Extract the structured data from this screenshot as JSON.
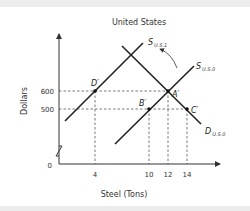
{
  "diagram": {
    "title": "United States",
    "x_axis_label": "Steel (Tons)",
    "y_axis_label": "Dollars",
    "origin_label": "0",
    "y_ticks": [
      {
        "label": "600",
        "value": 600
      },
      {
        "label": "500",
        "value": 500
      }
    ],
    "x_ticks": [
      {
        "label": "4",
        "value": 4
      },
      {
        "label": "10",
        "value": 10
      },
      {
        "label": "12",
        "value": 12
      },
      {
        "label": "14",
        "value": 14
      }
    ],
    "curves": [
      {
        "name": "S",
        "sub": "U.S.1",
        "type": "supply (shifted)"
      },
      {
        "name": "S",
        "sub": "U.S.0",
        "type": "supply (original)"
      },
      {
        "name": "D",
        "sub": "U.S.0",
        "type": "demand"
      }
    ],
    "points": [
      {
        "label": "D′",
        "x": 4,
        "y": 600
      },
      {
        "label": "A′",
        "x": 12,
        "y": 600
      },
      {
        "label": "B′",
        "x": 10,
        "y": 500
      },
      {
        "label": "C′",
        "x": 14,
        "y": 500
      }
    ],
    "annotation": "curved arrow indicating shift from S U.S.0 to S U.S.1"
  }
}
